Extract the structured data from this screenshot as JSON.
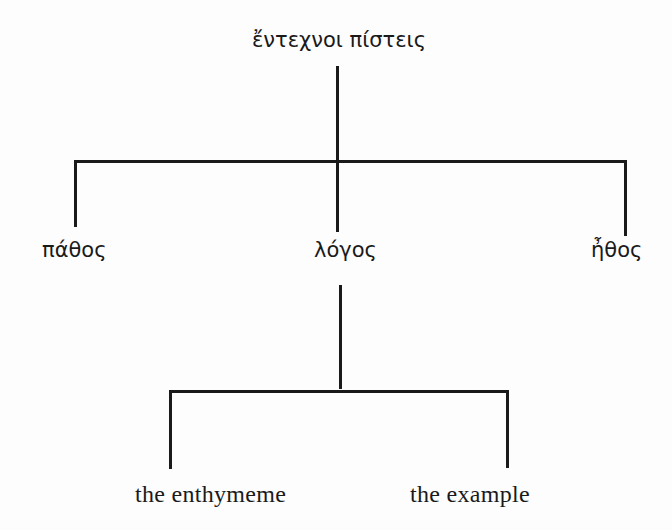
{
  "diagram": {
    "type": "tree",
    "root": {
      "label": "ἔντεχνοι πίστεις",
      "children": [
        {
          "label": "πάθος"
        },
        {
          "label": "λόγος",
          "children": [
            {
              "label": "the enthymeme"
            },
            {
              "label": "the example"
            }
          ]
        },
        {
          "label": "ἦθος"
        }
      ]
    },
    "colors": {
      "line": "#1a1a1a",
      "text": "#1a1a1a",
      "background": "#fdfdfd"
    }
  }
}
